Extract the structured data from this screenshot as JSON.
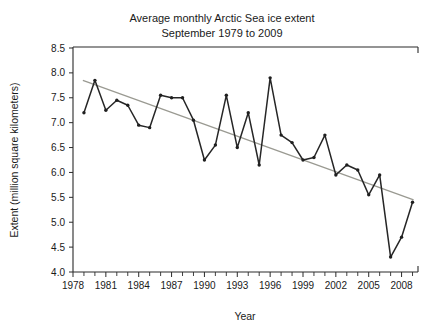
{
  "chart_data": {
    "type": "line",
    "title": "Average monthly Arctic Sea ice extent",
    "subtitle": "September 1979 to 2009",
    "xlabel": "Year",
    "ylabel": "Extent (million square kilometers)",
    "xlim": [
      1978,
      2009.5
    ],
    "ylim": [
      4.0,
      8.5
    ],
    "grid": false,
    "legend": null,
    "x_tick_labels": [
      "1978",
      "1981",
      "1984",
      "1987",
      "1990",
      "1993",
      "1996",
      "1999",
      "2002",
      "2005",
      "2008"
    ],
    "x_tick_values": [
      1978,
      1981,
      1984,
      1987,
      1990,
      1993,
      1996,
      1999,
      2002,
      2005,
      2008
    ],
    "x_minor_tick_step": 1,
    "y_tick_labels": [
      "4.0",
      "4.5",
      "5.0",
      "5.5",
      "6.0",
      "6.5",
      "7.0",
      "7.5",
      "8.0",
      "8.5"
    ],
    "y_tick_values": [
      4.0,
      4.5,
      5.0,
      5.5,
      6.0,
      6.5,
      7.0,
      7.5,
      8.0,
      8.5
    ],
    "x": [
      1979,
      1980,
      1981,
      1982,
      1983,
      1984,
      1985,
      1986,
      1987,
      1988,
      1989,
      1990,
      1991,
      1992,
      1993,
      1994,
      1995,
      1996,
      1997,
      1998,
      1999,
      2000,
      2001,
      2002,
      2003,
      2004,
      2005,
      2006,
      2007,
      2008,
      2009
    ],
    "values": [
      7.2,
      7.85,
      7.25,
      7.45,
      7.35,
      6.95,
      6.9,
      7.55,
      7.5,
      7.5,
      7.05,
      6.25,
      6.55,
      7.55,
      6.5,
      7.2,
      6.15,
      7.9,
      6.75,
      6.6,
      6.25,
      6.3,
      6.75,
      5.95,
      6.15,
      6.05,
      5.55,
      5.95,
      4.3,
      4.7,
      5.4
    ],
    "trend_line": {
      "name": "linear trend",
      "x": [
        1978.9,
        2009.1
      ],
      "y": [
        7.85,
        5.45
      ],
      "color": "#9a9a92"
    },
    "series_color": "#262626",
    "marker": "dot"
  }
}
